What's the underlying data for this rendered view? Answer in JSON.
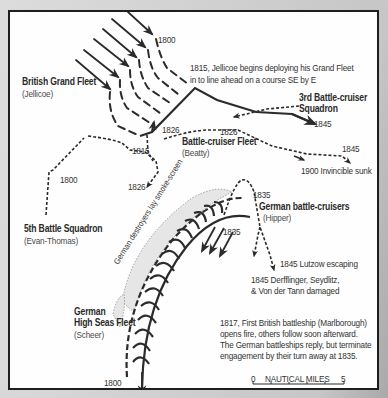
{
  "map": {
    "subject": "Battle of Jutland — fleet engagement 1800–1900",
    "fleets": [
      {
        "name": "British Grand Fleet",
        "commander": "(Jellicoe)"
      },
      {
        "name": "3rd Battle-cruiser",
        "name2": "Squadron"
      },
      {
        "name": "Battle-cruiser Fleet",
        "commander": "(Beatty)"
      },
      {
        "name": "5th Battle Squadron",
        "commander": "(Evan-Thomas)"
      },
      {
        "name": "German battle-cruisers",
        "commander": "(Hipper)"
      },
      {
        "name": "German",
        "name2": "High Seas Fleet",
        "commander": "(Scheer)"
      }
    ],
    "annotations": {
      "jellicoe_deploy_1": "1815, Jellicoe begins deploying his Grand Fleet",
      "jellicoe_deploy_2": "in to line ahead on a course SE by E",
      "invincible": "1900 Invincible sunk",
      "lutzow": "1845 Lutzow escaping",
      "damaged_1": "1845 Derfflinger, Seydlitz,",
      "damaged_2": "& Von der Tann damaged",
      "smoke_screen": "German destroyers lay smoke-screen",
      "marlborough_1": "1817, First British battleship (Marlborough)",
      "marlborough_2": "opens fire, others follow soon afterward.",
      "marlborough_3": "The German battleships reply, but terminate",
      "marlborough_4": "engagement by their turn away at 1835."
    },
    "times": {
      "grand_fleet_start": "1800",
      "grand_fleet_end": "1845",
      "bc_1826_a": "1826",
      "bc_1826_b": "1826",
      "bc_1845": "1845",
      "bc_1815": "1815",
      "fifth_1800": "1800",
      "fifth_1826": "1826",
      "hipper_1835": "1835",
      "hsf_1835": "1835",
      "hsf_1800": "1800"
    },
    "scale": {
      "start": "0",
      "label": "NAUTICAL MILES",
      "end": "5"
    },
    "colors": {
      "ink": "#2b2b2b",
      "paper": "#fefefe",
      "background": "#cfcfcf",
      "smoke": "#9a9a9a"
    }
  }
}
